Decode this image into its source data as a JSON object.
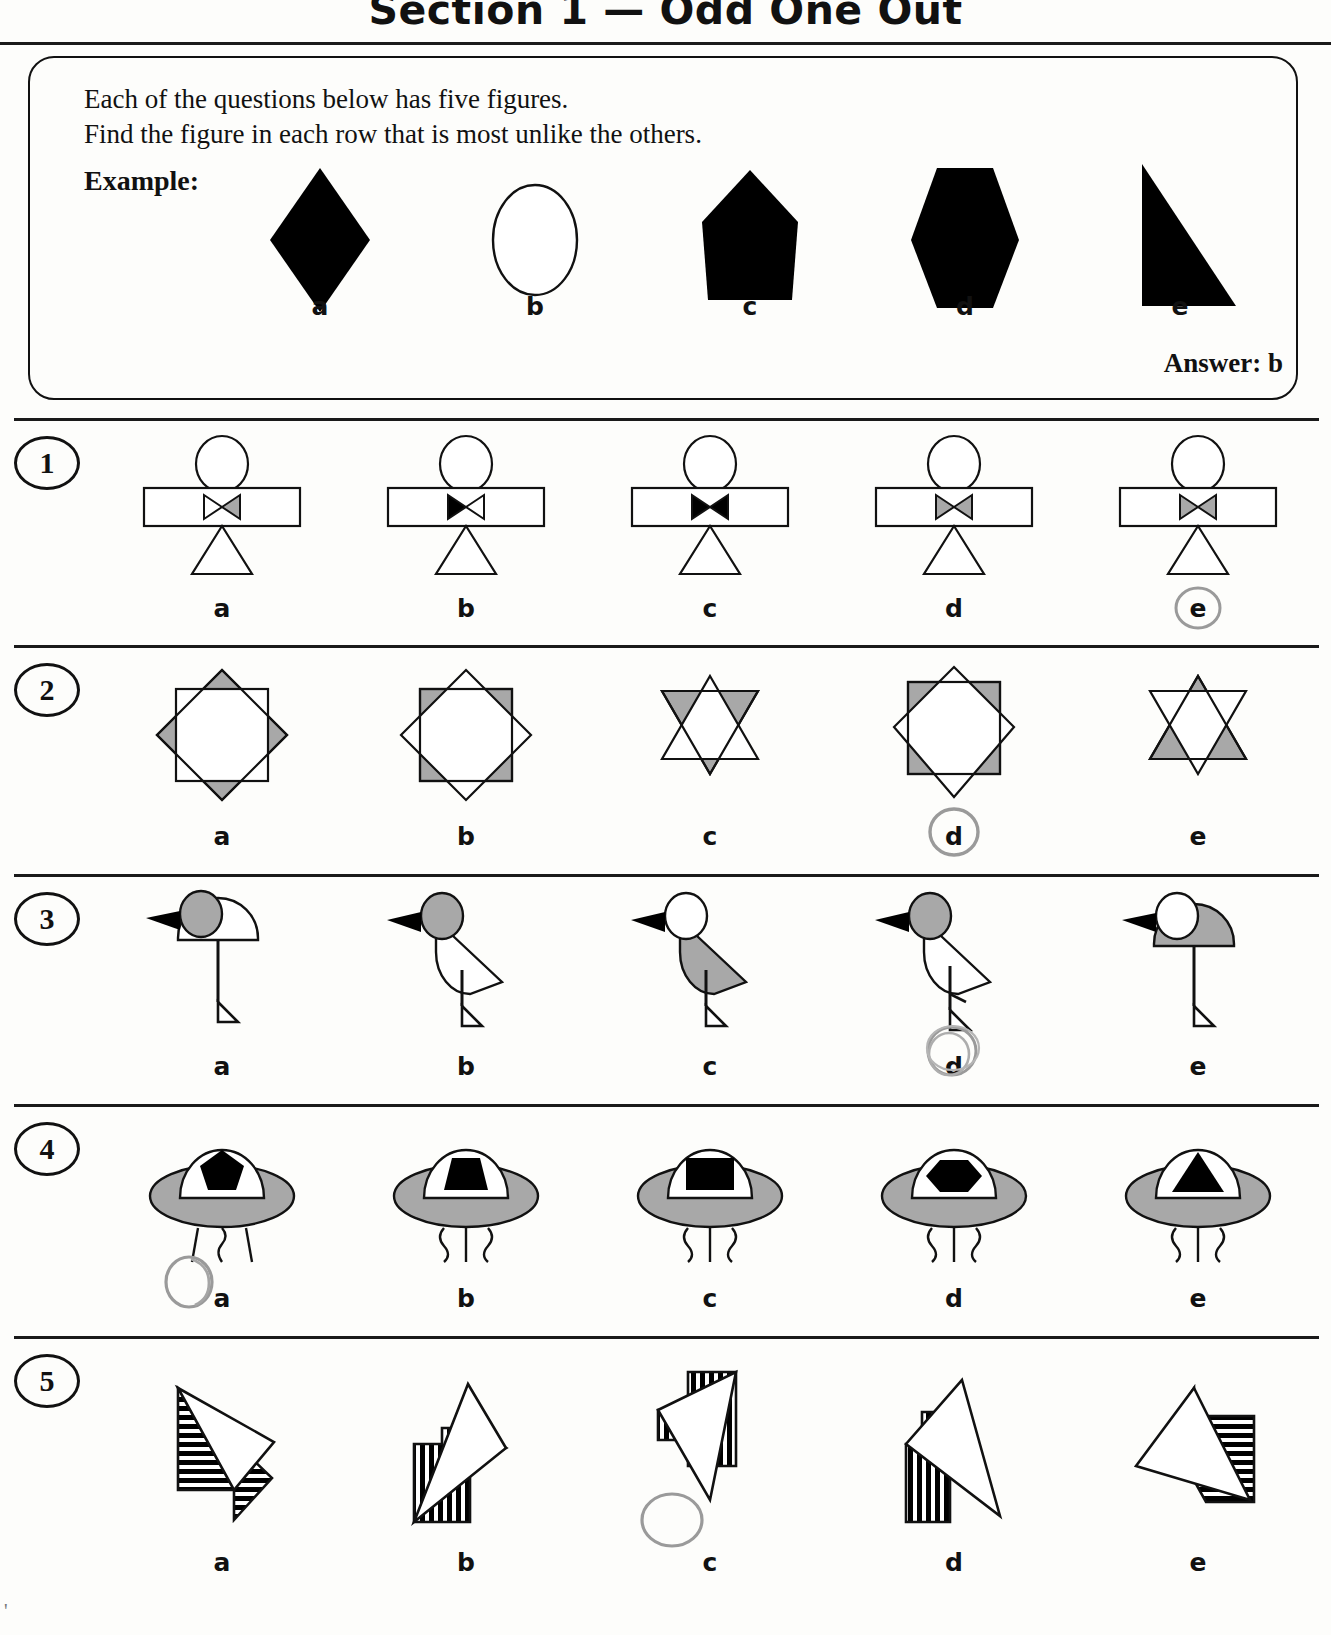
{
  "header": {
    "title": "Section 1 — Odd One Out"
  },
  "instructions": {
    "line1": "Each of the questions below has five figures.",
    "line2": "Find the figure in each row that is most unlike the others.",
    "example_label": "Example:",
    "answer_text": "Answer: b"
  },
  "colors": {
    "ink_black": "#111111",
    "shape_fill_black": "#000000",
    "shape_fill_gray": "#a8a8a8",
    "pencil_gray": "#9a9a9a",
    "page_background": "#fdfdfb"
  },
  "example": {
    "letters": [
      "a",
      "b",
      "c",
      "d",
      "e"
    ],
    "figures": [
      {
        "name": "diamond",
        "fill": "black"
      },
      {
        "name": "ellipse",
        "fill": "white"
      },
      {
        "name": "pentagon",
        "fill": "black"
      },
      {
        "name": "hexagon",
        "fill": "black"
      },
      {
        "name": "right-triangle",
        "fill": "black"
      }
    ],
    "answer": "b"
  },
  "questions": [
    {
      "number": "1",
      "theme": "stick-figure-with-bowtie",
      "letters": [
        "a",
        "b",
        "c",
        "d",
        "e"
      ],
      "marked_answer": "e",
      "figures": [
        {
          "letter": "a",
          "bowtie_left": "white",
          "bowtie_right": "gray"
        },
        {
          "letter": "b",
          "bowtie_left": "black",
          "bowtie_right": "white"
        },
        {
          "letter": "c",
          "bowtie_left": "black",
          "bowtie_right": "black"
        },
        {
          "letter": "d",
          "bowtie_left": "gray",
          "bowtie_right": "gray"
        },
        {
          "letter": "e",
          "bowtie_left": "gray",
          "bowtie_right": "gray"
        }
      ]
    },
    {
      "number": "2",
      "theme": "overlapping-squares-and-stars",
      "letters": [
        "a",
        "b",
        "c",
        "d",
        "e"
      ],
      "marked_answer": "d",
      "figures": [
        {
          "letter": "a",
          "shape": "square-over-diamond",
          "gray_layer": "diamond"
        },
        {
          "letter": "b",
          "shape": "square-over-diamond",
          "gray_layer": "square"
        },
        {
          "letter": "c",
          "shape": "six-point-star",
          "gray_layer": "down-triangle"
        },
        {
          "letter": "d",
          "shape": "square-over-diamond",
          "gray_layer": "square"
        },
        {
          "letter": "e",
          "shape": "six-point-star",
          "gray_layer": "up-triangle"
        }
      ]
    },
    {
      "number": "3",
      "theme": "birds",
      "letters": [
        "a",
        "b",
        "c",
        "d",
        "e"
      ],
      "marked_answer": "d",
      "figures": [
        {
          "letter": "a",
          "head": "gray",
          "body": "white",
          "body_shape": "dome",
          "legs": 1
        },
        {
          "letter": "b",
          "head": "gray",
          "body": "white",
          "body_shape": "wedge",
          "legs": 1
        },
        {
          "letter": "c",
          "head": "white",
          "body": "gray",
          "body_shape": "wedge",
          "legs": 1
        },
        {
          "letter": "d",
          "head": "gray",
          "body": "white",
          "body_shape": "wedge",
          "legs": 1
        },
        {
          "letter": "e",
          "head": "white",
          "body": "gray",
          "body_shape": "dome",
          "legs": 1
        }
      ]
    },
    {
      "number": "4",
      "theme": "flying-saucers",
      "letters": [
        "a",
        "b",
        "c",
        "d",
        "e"
      ],
      "marked_answer": "a",
      "figures": [
        {
          "letter": "a",
          "window_shape": "pentagon",
          "beam": "straight-wavy-straight"
        },
        {
          "letter": "b",
          "window_shape": "trapezoid",
          "beam": "wavy-straight-wavy"
        },
        {
          "letter": "c",
          "window_shape": "rectangle",
          "beam": "wavy-straight-wavy"
        },
        {
          "letter": "d",
          "window_shape": "hexagon",
          "beam": "wavy-straight-wavy"
        },
        {
          "letter": "e",
          "window_shape": "triangle",
          "beam": "wavy-straight-wavy"
        }
      ]
    },
    {
      "number": "5",
      "theme": "overlapping-striped-triangles",
      "letters": [
        "a",
        "b",
        "c",
        "d",
        "e"
      ],
      "marked_answer": "c",
      "figures": [
        {
          "letter": "a",
          "stripes": "horizontal"
        },
        {
          "letter": "b",
          "stripes": "vertical"
        },
        {
          "letter": "c",
          "stripes": "vertical"
        },
        {
          "letter": "d",
          "stripes": "vertical"
        },
        {
          "letter": "e",
          "stripes": "horizontal"
        }
      ]
    }
  ]
}
